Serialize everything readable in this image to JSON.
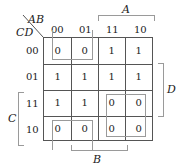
{
  "kmap": {
    "corner_top": "AB",
    "corner_left": "CD",
    "col_headers": [
      "00",
      "01",
      "11",
      "10"
    ],
    "row_headers": [
      "00",
      "01",
      "11",
      "10"
    ],
    "cells": [
      [
        "0",
        "0",
        "1",
        "1"
      ],
      [
        "1",
        "1",
        "1",
        "1"
      ],
      [
        "1",
        "1",
        "0",
        "0"
      ],
      [
        "0",
        "0",
        "0",
        "0"
      ]
    ],
    "var_labels": {
      "A": "A",
      "B": "B",
      "C": "C",
      "D": "D"
    }
  }
}
